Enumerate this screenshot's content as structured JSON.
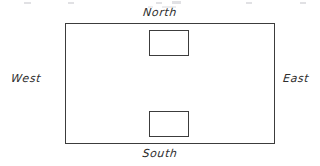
{
  "diagram": {
    "style": "hand-drawn line sketch",
    "background_color": "#ffffff",
    "stroke_color": "#3c3c3c",
    "text_color": "#2e2e2e",
    "labels": {
      "north": "North",
      "south": "South",
      "west": "West",
      "east": "East"
    },
    "shapes": {
      "outer_rectangle": {
        "name": "outer-boundary",
        "x": 65,
        "y": 23,
        "width": 210,
        "height": 121
      },
      "north_inner_rectangle": {
        "name": "north-inner-box",
        "x": 149,
        "y": 30,
        "width": 40,
        "height": 26
      },
      "south_inner_rectangle": {
        "name": "south-inner-box",
        "x": 149,
        "y": 111,
        "width": 40,
        "height": 26
      }
    }
  }
}
